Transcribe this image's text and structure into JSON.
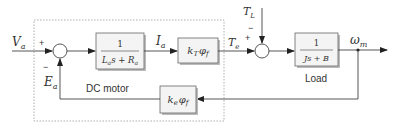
{
  "diagram": {
    "type": "control-block-diagram",
    "colors": {
      "line": "#444444",
      "block_fill": "#f4f4f4",
      "block_border": "#666666",
      "shadow": "#bbbbbb",
      "dashed_box": "#999999",
      "text": "#333333"
    },
    "subsystems": {
      "dc_motor_label": "DC motor",
      "load_label": "Load"
    },
    "signals": {
      "input_voltage": {
        "base": "V",
        "sub": "a"
      },
      "back_emf": {
        "base": "E",
        "sub": "a"
      },
      "armature_current": {
        "base": "I",
        "sub": "a"
      },
      "electric_torque": {
        "base": "T",
        "sub": "e"
      },
      "load_torque": {
        "base": "T",
        "sub": "L"
      },
      "motor_speed": {
        "base": "ω",
        "sub": "m"
      }
    },
    "summing_junctions": [
      {
        "id": "sum-armature",
        "plus": "+",
        "minus": "−"
      },
      {
        "id": "sum-torque",
        "plus": "+",
        "minus": "−"
      }
    ],
    "blocks": {
      "armature": {
        "numerator": "1",
        "den_L": "L",
        "den_L_sub": "a",
        "den_s": "s + ",
        "den_R": "R",
        "den_R_sub": "a"
      },
      "torque_const": {
        "k": "k",
        "k_sub": "T",
        "phi": "φ",
        "phi_sub": "f"
      },
      "load": {
        "numerator": "1",
        "denominator": "Js + B"
      },
      "emf_const": {
        "k": "k",
        "k_sub": "e",
        "phi": "φ",
        "phi_sub": "f"
      }
    }
  }
}
